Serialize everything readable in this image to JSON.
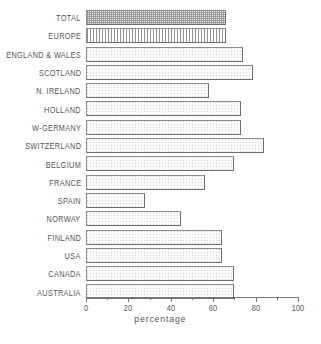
{
  "chart_data": {
    "type": "bar",
    "orientation": "horizontal",
    "title": "",
    "xlabel": "percentage",
    "ylabel": "",
    "xlim": [
      0,
      100
    ],
    "xticks": [
      0,
      20,
      40,
      60,
      80,
      100
    ],
    "xtick_labels": [
      "0",
      "20",
      "40",
      "60",
      "80",
      "100"
    ],
    "minor_ticks": [
      10,
      30,
      50,
      70,
      90
    ],
    "grid": false,
    "legend": null,
    "categories": [
      "TOTAL",
      "EUROPE",
      "ENGLAND & WALES",
      "SCOTLAND",
      "N. IRELAND",
      "HOLLAND",
      "W-GERMANY",
      "SWITZERLAND",
      "BELGIUM",
      "FRANCE",
      "SPAIN",
      "NORWAY",
      "FINLAND",
      "USA",
      "CANADA",
      "AUSTRALIA"
    ],
    "values": [
      66,
      66,
      74,
      79,
      58,
      73,
      73,
      84,
      70,
      56,
      28,
      45,
      64,
      64,
      70,
      70
    ],
    "bar_styles": [
      "dense",
      "vstripe",
      "light",
      "light",
      "light",
      "light",
      "light",
      "light",
      "light",
      "light",
      "light",
      "light",
      "light",
      "light",
      "light",
      "light"
    ]
  },
  "colors": {
    "background": "#ffffff",
    "bar_edge": "#8c8c8c",
    "bar_light_fill": "#fbfbfb",
    "bar_dense_fill": "#9a9a9a",
    "bar_stripe_fill": "#8f8f8f",
    "axis": "#777777",
    "text": "#555555"
  }
}
